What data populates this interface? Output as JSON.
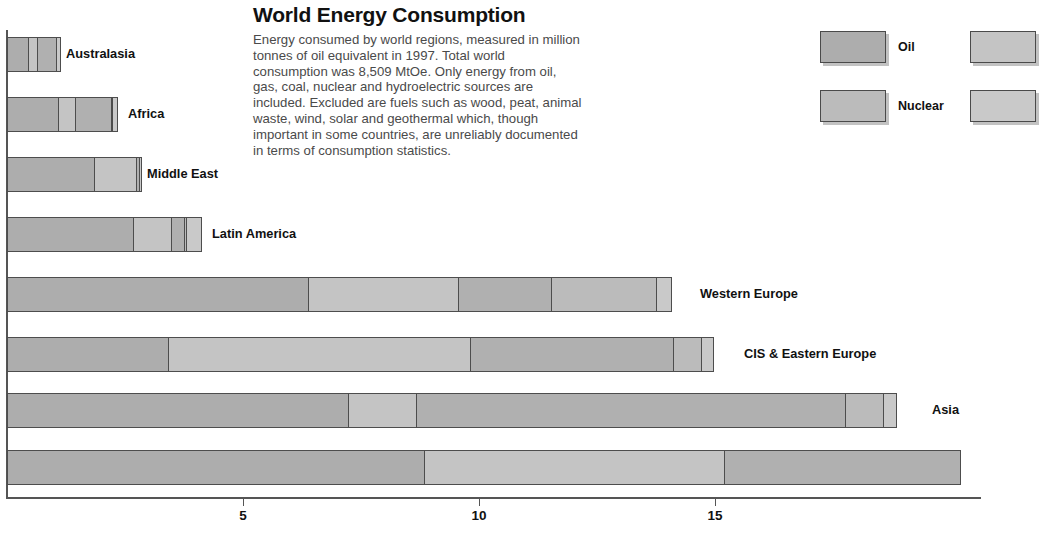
{
  "header": {
    "title": "World Energy Consumption",
    "description": "Energy consumed by world regions, measured in million tonnes of oil equivalent in 1997. Total world consumption was 8,509 MtOe. Only energy from oil, gas, coal, nuclear and hydroelectric sources are included. Excluded are fuels such as wood, peat, animal waste, wind, solar and geothermal which, though important in some countries, are unreliably documented in terms of consumption statistics."
  },
  "legend": {
    "column1": [
      {
        "label": "Oil",
        "color": "#adadad"
      },
      {
        "label": "Nuclear",
        "color": "#bbbbbb"
      }
    ],
    "column2": [
      {
        "label": "",
        "color": "#c4c4c4"
      },
      {
        "label": "",
        "color": "#c9c9c9"
      }
    ]
  },
  "axis": {
    "ticks": [
      {
        "label": "5",
        "value": 5
      },
      {
        "label": "10",
        "value": 10
      },
      {
        "label": "15",
        "value": 15
      }
    ],
    "min": 0,
    "max": 20.1
  },
  "chart_data": {
    "type": "bar",
    "orientation": "horizontal",
    "stacked": true,
    "title": "World Energy Consumption",
    "xlabel": "",
    "ylabel": "",
    "unit": "hundred million tonnes of oil equivalent (scale units)",
    "xlim": [
      0,
      20.1
    ],
    "grid": false,
    "legend_position": "top-right",
    "series": [
      {
        "name": "Oil",
        "key": "oil"
      },
      {
        "name": "Gas",
        "key": "gas"
      },
      {
        "name": "Coal",
        "key": "coal"
      },
      {
        "name": "Nuclear",
        "key": "nuclear"
      },
      {
        "name": "Hydro",
        "key": "hydro"
      }
    ],
    "categories": [
      "Australasia",
      "Africa",
      "Middle East",
      "Latin America",
      "Western Europe",
      "CIS & Eastern Europe",
      "Asia",
      "North America"
    ],
    "rows": [
      {
        "category": "Australasia",
        "label": "Australasia",
        "label_x": 66,
        "segments": [
          {
            "key": "oil",
            "value": 0.47
          },
          {
            "key": "gas",
            "value": 0.2
          },
          {
            "key": "coal",
            "value": 0.4
          },
          {
            "key": "nuclear",
            "value": 0.0
          },
          {
            "key": "hydro",
            "value": 0.07
          }
        ],
        "total": 1.14
      },
      {
        "category": "Africa",
        "label": "Africa",
        "label_x": 128,
        "segments": [
          {
            "key": "oil",
            "value": 1.1
          },
          {
            "key": "gas",
            "value": 0.36
          },
          {
            "key": "coal",
            "value": 0.78
          },
          {
            "key": "nuclear",
            "value": 0.03
          },
          {
            "key": "hydro",
            "value": 0.09
          }
        ],
        "total": 2.36
      },
      {
        "category": "Middle East",
        "label": "Middle East",
        "label_x": 147,
        "segments": [
          {
            "key": "oil",
            "value": 1.88
          },
          {
            "key": "gas",
            "value": 0.89
          },
          {
            "key": "coal",
            "value": 0.06
          },
          {
            "key": "nuclear",
            "value": 0.0
          },
          {
            "key": "hydro",
            "value": 0.04
          }
        ],
        "total": 2.87
      },
      {
        "category": "Latin America",
        "label": "Latin America",
        "label_x": 212,
        "segments": [
          {
            "key": "oil",
            "value": 2.69
          },
          {
            "key": "gas",
            "value": 0.83
          },
          {
            "key": "coal",
            "value": 0.26
          },
          {
            "key": "nuclear",
            "value": 0.06
          },
          {
            "key": "hydro",
            "value": 0.3
          }
        ],
        "total": 4.14
      },
      {
        "category": "Western Europe",
        "label": "Western Europe",
        "label_x": 700,
        "segments": [
          {
            "key": "oil",
            "value": 6.4
          },
          {
            "key": "gas",
            "value": 3.18
          },
          {
            "key": "coal",
            "value": 1.99
          },
          {
            "key": "nuclear",
            "value": 2.23
          },
          {
            "key": "hydro",
            "value": 0.28
          }
        ],
        "total": 14.08
      },
      {
        "category": "CIS & Eastern Europe",
        "label": "CIS & Eastern Europe",
        "label_x": 744,
        "segments": [
          {
            "key": "oil",
            "value": 3.43
          },
          {
            "key": "gas",
            "value": 6.4
          },
          {
            "key": "coal",
            "value": 4.32
          },
          {
            "key": "nuclear",
            "value": 0.59
          },
          {
            "key": "hydro",
            "value": 0.23
          }
        ],
        "total": 14.97
      },
      {
        "category": "Asia",
        "label": "Asia",
        "label_x": 932,
        "segments": [
          {
            "key": "oil",
            "value": 7.24
          },
          {
            "key": "gas",
            "value": 1.44
          },
          {
            "key": "coal",
            "value": 9.11
          },
          {
            "key": "nuclear",
            "value": 0.81
          },
          {
            "key": "hydro",
            "value": 0.25
          }
        ],
        "total": 18.85
      },
      {
        "category": "North America",
        "label": "",
        "label_x": 990,
        "segments": [
          {
            "key": "oil",
            "value": 8.86
          },
          {
            "key": "gas",
            "value": 6.36
          },
          {
            "key": "coal",
            "value": 5.0
          },
          {
            "key": "nuclear",
            "value": 0.0
          },
          {
            "key": "hydro",
            "value": 0.0
          }
        ],
        "total": 20.22
      }
    ]
  }
}
